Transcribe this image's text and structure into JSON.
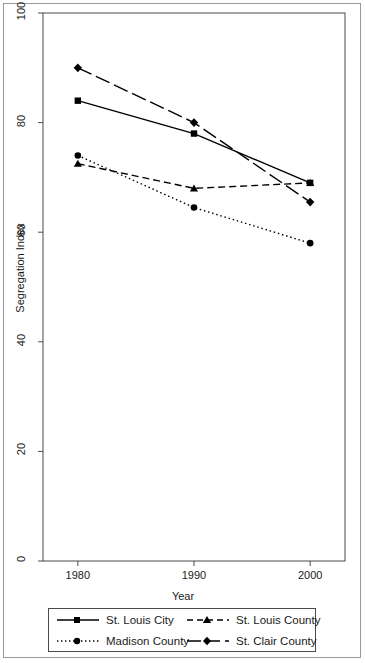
{
  "chart_data": {
    "type": "line",
    "title": "",
    "xlabel": "Year",
    "ylabel": "Segregation Index",
    "x": [
      1980,
      1990,
      2000
    ],
    "xtick_labels": [
      "1980",
      "1990",
      "2000"
    ],
    "ytick_labels": [
      "0",
      "20",
      "40",
      "60",
      "80",
      "100"
    ],
    "yticks": [
      0,
      20,
      40,
      60,
      80,
      100
    ],
    "xlim": [
      1977,
      2003
    ],
    "ylim": [
      0,
      100
    ],
    "grid": false,
    "legend_position": "bottom",
    "series": [
      {
        "name": "St. Louis City",
        "values": [
          84,
          78,
          69
        ],
        "line_style": "solid",
        "marker": "square",
        "color": "#000000"
      },
      {
        "name": "St. Louis County",
        "values": [
          72.5,
          68,
          69
        ],
        "line_style": "dashed",
        "marker": "triangle",
        "color": "#000000"
      },
      {
        "name": "Madison County",
        "values": [
          74,
          64.5,
          58
        ],
        "line_style": "dotted",
        "marker": "circle",
        "color": "#000000"
      },
      {
        "name": "St. Clair County",
        "values": [
          90,
          80,
          65.5
        ],
        "line_style": "longdash",
        "marker": "diamond",
        "color": "#000000"
      }
    ]
  },
  "legend": {
    "entries": [
      {
        "label": "St. Louis City",
        "key": "solid-square-key"
      },
      {
        "label": "St. Louis County",
        "key": "dashed-triangle-key"
      },
      {
        "label": "Madison County",
        "key": "dotted-circle-key"
      },
      {
        "label": "St. Clair County",
        "key": "longdash-diamond-key"
      }
    ]
  }
}
